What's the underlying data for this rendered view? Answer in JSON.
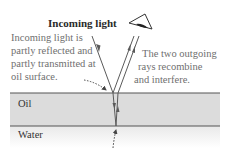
{
  "diagram": {
    "title": "Incoming light",
    "left_note": {
      "lines": [
        "Incoming light is",
        "partly reflected and",
        "partly transmitted at",
        "oil surface."
      ]
    },
    "right_note": {
      "lines": [
        "The two outgoing",
        "rays recombine",
        "and interfere."
      ]
    },
    "layers": {
      "oil": "Oil",
      "water": "Water"
    },
    "colors": {
      "oil_fill": "#dcdcdc",
      "boundary": "#555555",
      "ray": "#5a5a5a",
      "text_gray": "#6f6f6f"
    }
  }
}
